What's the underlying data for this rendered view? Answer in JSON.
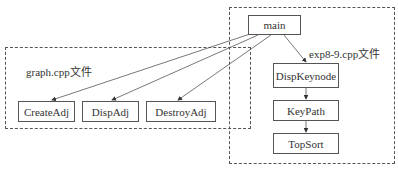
{
  "groups": {
    "graph": {
      "label": "graph.cpp文件"
    },
    "exp": {
      "label": "exp8-9.cpp文件"
    }
  },
  "nodes": {
    "main": "main",
    "dispkeynode": "DispKeynode",
    "keypath": "KeyPath",
    "topsort": "TopSort",
    "createadj": "CreateAdj",
    "dispadj": "DispAdj",
    "destroyadj": "DestroyAdj"
  },
  "edges": [
    {
      "from": "main",
      "to": "CreateAdj"
    },
    {
      "from": "main",
      "to": "DispAdj"
    },
    {
      "from": "main",
      "to": "DestroyAdj"
    },
    {
      "from": "main",
      "to": "DispKeynode"
    },
    {
      "from": "DispKeynode",
      "to": "KeyPath"
    },
    {
      "from": "KeyPath",
      "to": "TopSort"
    }
  ],
  "colors": {
    "line": "#555555",
    "text": "#333333",
    "background": "#ffffff"
  }
}
